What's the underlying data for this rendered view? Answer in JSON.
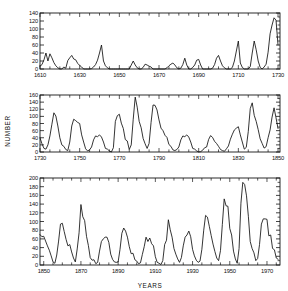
{
  "figure": {
    "background": "#ffffff",
    "line_color": "#101010",
    "axis_color": "#151515",
    "axis_titles": {
      "y": "NUMBER",
      "x": "YEARS"
    }
  },
  "chart_data": [
    {
      "type": "line",
      "panel": 1,
      "title": "",
      "xlabel": "",
      "ylabel": "NUMBER",
      "xlim": [
        1610,
        1731
      ],
      "ylim": [
        0,
        140
      ],
      "grid": false,
      "legend": null,
      "yticks": [
        0,
        20,
        40,
        60,
        80,
        100,
        120,
        140
      ],
      "ytick_labels": [
        "0",
        "20",
        "40",
        "60",
        "80",
        "100",
        "120",
        "140"
      ],
      "xticks": [
        1610,
        1630,
        1650,
        1670,
        1690,
        1710,
        1730
      ],
      "xtick_labels": [
        "1610",
        "1630",
        "1650",
        "1670",
        "1690",
        "1710",
        "1730"
      ],
      "xtick_minor_step": 5,
      "x": [
        1610,
        1611,
        1612,
        1613,
        1614,
        1615,
        1616,
        1617,
        1618,
        1619,
        1620,
        1621,
        1622,
        1623,
        1624,
        1625,
        1626,
        1627,
        1628,
        1629,
        1630,
        1631,
        1632,
        1633,
        1634,
        1635,
        1636,
        1637,
        1638,
        1639,
        1640,
        1641,
        1642,
        1643,
        1644,
        1645,
        1646,
        1647,
        1648,
        1649,
        1650,
        1651,
        1652,
        1653,
        1654,
        1655,
        1656,
        1657,
        1658,
        1659,
        1660,
        1661,
        1662,
        1663,
        1664,
        1665,
        1666,
        1667,
        1668,
        1669,
        1670,
        1671,
        1672,
        1673,
        1674,
        1675,
        1676,
        1677,
        1678,
        1679,
        1680,
        1681,
        1682,
        1683,
        1684,
        1685,
        1686,
        1687,
        1688,
        1689,
        1690,
        1691,
        1692,
        1693,
        1694,
        1695,
        1696,
        1697,
        1698,
        1699,
        1700,
        1701,
        1702,
        1703,
        1704,
        1705,
        1706,
        1707,
        1708,
        1709,
        1710,
        1711,
        1712,
        1713,
        1714,
        1715,
        1716,
        1717,
        1718,
        1719,
        1720,
        1721,
        1722,
        1723,
        1724,
        1725,
        1726,
        1727,
        1728,
        1729,
        1730
      ],
      "y": [
        7,
        11,
        23,
        40,
        20,
        38,
        28,
        16,
        8,
        3,
        0,
        0,
        5,
        2,
        21,
        28,
        34,
        25,
        23,
        14,
        9,
        5,
        0,
        0,
        0,
        0,
        1,
        5,
        11,
        22,
        40,
        60,
        20,
        8,
        3,
        0,
        0,
        0,
        0,
        0,
        0,
        0,
        0,
        0,
        0,
        0,
        10,
        20,
        10,
        3,
        0,
        0,
        4,
        12,
        10,
        7,
        5,
        0,
        0,
        0,
        0,
        0,
        0,
        0,
        3,
        8,
        12,
        15,
        10,
        3,
        0,
        2,
        11,
        27,
        10,
        0,
        0,
        4,
        10,
        22,
        24,
        10,
        0,
        0,
        0,
        0,
        0,
        2,
        11,
        27,
        34,
        20,
        8,
        3,
        0,
        0,
        0,
        4,
        20,
        45,
        70,
        15,
        4,
        0,
        0,
        0,
        6,
        40,
        70,
        48,
        20,
        4,
        0,
        5,
        12,
        42,
        88,
        110,
        128,
        122,
        60
      ]
    },
    {
      "type": "line",
      "panel": 2,
      "title": "",
      "xlabel": "",
      "ylabel": "NUMBER",
      "xlim": [
        1730,
        1851
      ],
      "ylim": [
        0,
        160
      ],
      "grid": false,
      "legend": null,
      "yticks": [
        0,
        20,
        40,
        60,
        80,
        100,
        120,
        140,
        160
      ],
      "ytick_labels": [
        "0",
        "20",
        "40",
        "60",
        "80",
        "100",
        "120",
        "140",
        "160"
      ],
      "xticks": [
        1730,
        1750,
        1770,
        1790,
        1810,
        1830,
        1850
      ],
      "xtick_labels": [
        "1730",
        "1750",
        "1770",
        "1790",
        "1810",
        "1830",
        "1850"
      ],
      "xtick_minor_step": 5,
      "x": [
        1730,
        1731,
        1732,
        1733,
        1734,
        1735,
        1736,
        1737,
        1738,
        1739,
        1740,
        1741,
        1742,
        1743,
        1744,
        1745,
        1746,
        1747,
        1748,
        1749,
        1750,
        1751,
        1752,
        1753,
        1754,
        1755,
        1756,
        1757,
        1758,
        1759,
        1760,
        1761,
        1762,
        1763,
        1764,
        1765,
        1766,
        1767,
        1768,
        1769,
        1770,
        1771,
        1772,
        1773,
        1774,
        1775,
        1776,
        1777,
        1778,
        1779,
        1780,
        1781,
        1782,
        1783,
        1784,
        1785,
        1786,
        1787,
        1788,
        1789,
        1790,
        1791,
        1792,
        1793,
        1794,
        1795,
        1796,
        1797,
        1798,
        1799,
        1800,
        1801,
        1802,
        1803,
        1804,
        1805,
        1806,
        1807,
        1808,
        1809,
        1810,
        1811,
        1812,
        1813,
        1814,
        1815,
        1816,
        1817,
        1818,
        1819,
        1820,
        1821,
        1822,
        1823,
        1824,
        1825,
        1826,
        1827,
        1828,
        1829,
        1830,
        1831,
        1832,
        1833,
        1834,
        1835,
        1836,
        1837,
        1838,
        1839,
        1840,
        1841,
        1842,
        1843,
        1844,
        1845,
        1846,
        1847,
        1848,
        1849,
        1850
      ],
      "y": [
        40,
        23,
        10,
        8,
        20,
        45,
        78,
        110,
        101,
        73,
        40,
        20,
        16,
        7,
        4,
        28,
        73,
        92,
        88,
        83,
        80,
        48,
        28,
        9,
        3,
        6,
        14,
        34,
        45,
        43,
        48,
        42,
        28,
        10,
        8,
        3,
        0,
        12,
        86,
        102,
        106,
        81,
        66,
        35,
        31,
        7,
        20,
        92,
        154,
        126,
        86,
        68,
        38,
        23,
        10,
        24,
        83,
        132,
        131,
        118,
        90,
        67,
        60,
        47,
        41,
        21,
        16,
        6,
        4,
        7,
        14,
        34,
        45,
        43,
        48,
        42,
        28,
        10,
        8,
        3,
        0,
        1,
        5,
        12,
        14,
        35,
        46,
        41,
        30,
        24,
        16,
        7,
        4,
        2,
        9,
        17,
        36,
        50,
        62,
        67,
        71,
        48,
        28,
        8,
        13,
        57,
        122,
        138,
        103,
        86,
        63,
        37,
        24,
        11,
        15,
        40,
        62,
        98,
        124,
        96,
        66
      ]
    },
    {
      "type": "line",
      "panel": 3,
      "title": "",
      "xlabel": "YEARS",
      "ylabel": "NUMBER",
      "xlim": [
        1848,
        1977
      ],
      "ylim": [
        0,
        200
      ],
      "grid": false,
      "legend": null,
      "yticks": [
        0,
        20,
        40,
        60,
        80,
        100,
        120,
        140,
        160,
        180,
        200
      ],
      "ytick_labels": [
        "0",
        "20",
        "40",
        "60",
        "80",
        "100",
        "120",
        "140",
        "160",
        "180",
        "200"
      ],
      "xticks": [
        1850,
        1870,
        1890,
        1910,
        1930,
        1950,
        1970
      ],
      "xtick_labels": [
        "1850",
        "1870",
        "1890",
        "1910",
        "1930",
        "1950",
        "1970"
      ],
      "xtick_minor_step": 5,
      "x": [
        1848,
        1849,
        1850,
        1851,
        1852,
        1853,
        1854,
        1855,
        1856,
        1857,
        1858,
        1859,
        1860,
        1861,
        1862,
        1863,
        1864,
        1865,
        1866,
        1867,
        1868,
        1869,
        1870,
        1871,
        1872,
        1873,
        1874,
        1875,
        1876,
        1877,
        1878,
        1879,
        1880,
        1881,
        1882,
        1883,
        1884,
        1885,
        1886,
        1887,
        1888,
        1889,
        1890,
        1891,
        1892,
        1893,
        1894,
        1895,
        1896,
        1897,
        1898,
        1899,
        1900,
        1901,
        1902,
        1903,
        1904,
        1905,
        1906,
        1907,
        1908,
        1909,
        1910,
        1911,
        1912,
        1913,
        1914,
        1915,
        1916,
        1917,
        1918,
        1919,
        1920,
        1921,
        1922,
        1923,
        1924,
        1925,
        1926,
        1927,
        1928,
        1929,
        1930,
        1931,
        1932,
        1933,
        1934,
        1935,
        1936,
        1937,
        1938,
        1939,
        1940,
        1941,
        1942,
        1943,
        1944,
        1945,
        1946,
        1947,
        1948,
        1949,
        1950,
        1951,
        1952,
        1953,
        1954,
        1955,
        1956,
        1957,
        1958,
        1959,
        1960,
        1961,
        1962,
        1963,
        1964,
        1965,
        1966,
        1967,
        1968,
        1969,
        1970,
        1971,
        1972,
        1973,
        1974,
        1975,
        1976
      ],
      "y": [
        70,
        65,
        66,
        55,
        44,
        34,
        21,
        7,
        4,
        23,
        55,
        94,
        96,
        77,
        59,
        44,
        47,
        30,
        16,
        7,
        37,
        74,
        139,
        111,
        102,
        66,
        45,
        17,
        11,
        12,
        3,
        6,
        32,
        54,
        60,
        64,
        64,
        52,
        25,
        13,
        7,
        6,
        7,
        36,
        73,
        85,
        78,
        64,
        42,
        26,
        27,
        12,
        9,
        3,
        5,
        24,
        42,
        64,
        54,
        62,
        49,
        44,
        19,
        6,
        4,
        1,
        10,
        47,
        57,
        104,
        81,
        64,
        38,
        25,
        14,
        6,
        17,
        44,
        64,
        69,
        78,
        65,
        36,
        21,
        11,
        6,
        9,
        36,
        80,
        114,
        110,
        89,
        68,
        48,
        31,
        16,
        10,
        33,
        93,
        152,
        136,
        135,
        84,
        69,
        32,
        14,
        4,
        38,
        142,
        190,
        185,
        159,
        112,
        54,
        38,
        28,
        10,
        15,
        47,
        94,
        106,
        106,
        105,
        67,
        69,
        38,
        35,
        16,
        13
      ]
    }
  ]
}
